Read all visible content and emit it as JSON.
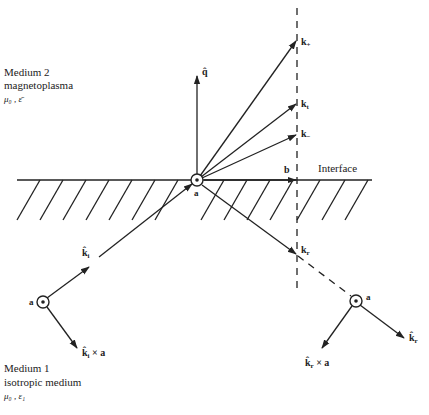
{
  "medium2": {
    "name": "Medium 2",
    "type": "magnetoplasma",
    "params": "μ₀ , ε̄"
  },
  "medium1": {
    "name": "Medium 1",
    "type": "isotropic medium",
    "params": "μ₀ , ε₁"
  },
  "interface_label": "Interface",
  "vectors": {
    "q_hat": "q̂",
    "k_plus": "k",
    "k_plus_sub": "+",
    "k_t": "k",
    "k_t_sub": "t",
    "k_minus": "k",
    "k_minus_sub": "−",
    "b": "b",
    "k_r": "k",
    "k_r_sub": "r",
    "k_i_hat": "k̂",
    "k_i_hat_sub": "i",
    "k_i_cross_a": "k̂",
    "k_i_cross_a_sub": "i",
    "k_i_cross_a_rest": " × a",
    "k_r_hat": "k̂",
    "k_r_hat_sub": "r",
    "k_r_cross_a": "k̂",
    "k_r_cross_a_sub": "r",
    "k_r_cross_a_rest": " × a",
    "a_origin": "a",
    "a_left": "a",
    "a_right": "a"
  },
  "colors": {
    "ink": "#222222",
    "background": "#ffffff"
  }
}
